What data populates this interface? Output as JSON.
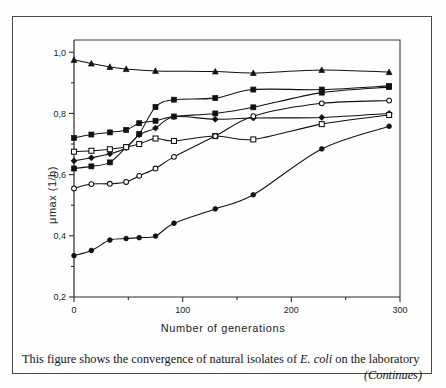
{
  "figure": {
    "xaxis_title": "Number of generations",
    "yaxis_title": "μmax  (1/h)",
    "caption_main": "This figure shows the convergence of natural isolates of ",
    "caption_italic": "E. coli",
    "caption_tail": " on the laboratory",
    "caption_continues": "(Continues)"
  },
  "chart_data": {
    "type": "line",
    "title": "",
    "xlabel": "Number of generations",
    "ylabel": "μmax (1/h)",
    "xlim": [
      0,
      300
    ],
    "ylim": [
      0.2,
      1.04
    ],
    "xticks": [
      0,
      100,
      200,
      300
    ],
    "xtick_labels": [
      "0",
      "100",
      "200",
      "300"
    ],
    "xminor_ticks": [
      50,
      150,
      250
    ],
    "yticks": [
      0.2,
      0.4,
      0.6,
      0.8,
      1.0
    ],
    "ytick_labels": [
      "0,2",
      "0,4",
      "0,6",
      "0,8",
      "1,0"
    ],
    "yminor_ticks": [
      0.3,
      0.5,
      0.7,
      0.9
    ],
    "grid": false,
    "legend": "none",
    "decimal_separator": ",",
    "series": [
      {
        "name": "isolate-A",
        "marker": "filled-triangle",
        "x": [
          0,
          16,
          33,
          48,
          75,
          130,
          165,
          228,
          290
        ],
        "values": [
          0.975,
          0.963,
          0.952,
          0.945,
          0.939,
          0.937,
          0.932,
          0.942,
          0.935
        ]
      },
      {
        "name": "isolate-B",
        "marker": "filled-square",
        "x": [
          0,
          16,
          33,
          48,
          60,
          75,
          92,
          130,
          165,
          228,
          290
        ],
        "values": [
          0.72,
          0.731,
          0.738,
          0.746,
          0.768,
          0.776,
          0.79,
          0.8,
          0.82,
          0.868,
          0.886
        ]
      },
      {
        "name": "isolate-C",
        "marker": "filled-square",
        "x": [
          0,
          16,
          33,
          48,
          60,
          75,
          92,
          130,
          165,
          228,
          290
        ],
        "values": [
          0.62,
          0.627,
          0.64,
          0.69,
          0.733,
          0.821,
          0.845,
          0.85,
          0.878,
          0.878,
          0.89
        ]
      },
      {
        "name": "isolate-D",
        "marker": "filled-diamond",
        "x": [
          0,
          16,
          33,
          48,
          60,
          75,
          92,
          130,
          165,
          228,
          290
        ],
        "values": [
          0.645,
          0.655,
          0.668,
          0.688,
          0.73,
          0.752,
          0.789,
          0.781,
          0.785,
          0.787,
          0.8
        ]
      },
      {
        "name": "isolate-E",
        "marker": "open-square",
        "x": [
          0,
          16,
          33,
          48,
          60,
          75,
          92,
          130,
          165,
          228,
          290
        ],
        "values": [
          0.675,
          0.678,
          0.683,
          0.69,
          0.7,
          0.718,
          0.71,
          0.726,
          0.715,
          0.765,
          0.795
        ]
      },
      {
        "name": "isolate-F",
        "marker": "open-circle",
        "x": [
          0,
          16,
          33,
          48,
          60,
          75,
          92,
          130,
          165,
          228,
          290
        ],
        "values": [
          0.555,
          0.569,
          0.57,
          0.576,
          0.596,
          0.62,
          0.658,
          0.726,
          0.791,
          0.833,
          0.842
        ]
      },
      {
        "name": "isolate-G",
        "marker": "filled-circle",
        "x": [
          0,
          16,
          33,
          48,
          60,
          75,
          92,
          130,
          165,
          228,
          290
        ],
        "values": [
          0.335,
          0.352,
          0.386,
          0.391,
          0.394,
          0.399,
          0.441,
          0.488,
          0.534,
          0.684,
          0.758
        ]
      }
    ]
  }
}
